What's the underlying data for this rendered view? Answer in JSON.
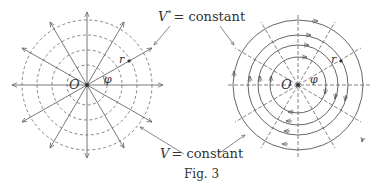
{
  "figure": {
    "caption": "Fig. 3",
    "label_top": {
      "var": "V",
      "sup": "*",
      "text": "= constant"
    },
    "label_bottom": {
      "var": "V",
      "text": "= constant"
    }
  },
  "left_diagram": {
    "center_label": "O",
    "radius_label": "r",
    "angle_label": "φ",
    "radial_arrows": 12,
    "dashed_circles": 4
  },
  "right_diagram": {
    "center_label": "O",
    "radius_label": "r",
    "angle_label": "φ",
    "dashed_radials": 12,
    "solid_circles": 4
  },
  "colors": {
    "line": "#555555",
    "text": "#333333",
    "background": "#ffffff"
  }
}
